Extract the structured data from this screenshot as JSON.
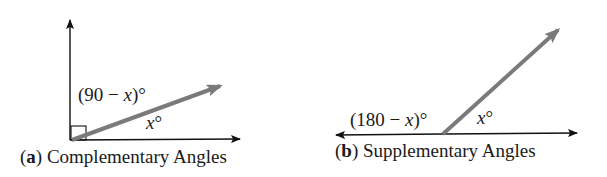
{
  "figure": {
    "panel_a": {
      "letter": "a",
      "caption": "Complementary Angles",
      "angle_label_upper_prefix": "(90 − ",
      "angle_label_upper_var": "x",
      "angle_label_upper_suffix": ")°",
      "angle_label_lower_var": "x",
      "angle_label_lower_suffix": "°",
      "right_angle_marker": true
    },
    "panel_b": {
      "letter": "b",
      "caption": "Supplementary Angles",
      "angle_label_left_prefix": "(180 − ",
      "angle_label_left_var": "x",
      "angle_label_left_suffix": ")°",
      "angle_label_right_var": "x",
      "angle_label_right_suffix": "°"
    },
    "colors": {
      "axis": "#111111",
      "ray": "#7a7a7a",
      "text": "#1a1a1a"
    }
  }
}
